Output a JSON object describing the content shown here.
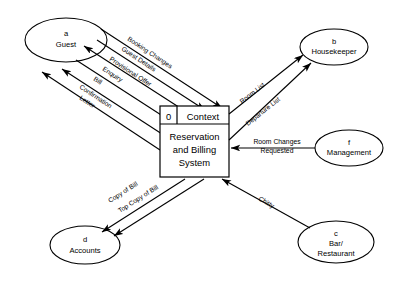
{
  "diagram": {
    "type": "data-flow-diagram",
    "level": "context",
    "colors": {
      "stroke": "#000000",
      "fill": "#ffffff",
      "background": "#ffffff"
    }
  },
  "process": {
    "id": "0",
    "header_label": "Context",
    "name_line1": "Reservation",
    "name_line2": "and Billing",
    "name_line3": "System"
  },
  "entities": [
    {
      "key": "a",
      "id": "a",
      "name": "Guest"
    },
    {
      "key": "b",
      "id": "b",
      "name": "Housekeeper"
    },
    {
      "key": "f",
      "id": "f",
      "name": "Management"
    },
    {
      "key": "c",
      "id": "c",
      "name_line1": "Bar/",
      "name_line2": "Restaurant"
    },
    {
      "key": "d",
      "id": "d",
      "name": "Accounts"
    }
  ],
  "flows": [
    {
      "key": "booking_changes",
      "label": "Booking Changes",
      "from": "a",
      "to": "0"
    },
    {
      "key": "guest_details",
      "label": "Guest Details",
      "from": "a",
      "to": "0"
    },
    {
      "key": "provisional_offer",
      "label": "Provisional Offer",
      "from": "0",
      "to": "a"
    },
    {
      "key": "enquiry",
      "label": "Enquiry",
      "from": "a",
      "to": "0"
    },
    {
      "key": "bill",
      "label": "Bill",
      "from": "0",
      "to": "a"
    },
    {
      "key": "confirmation_letter_1",
      "label": "Confirmation",
      "from": "0",
      "to": "a"
    },
    {
      "key": "confirmation_letter_2",
      "label": "Letter",
      "from": "0",
      "to": "a"
    },
    {
      "key": "room_list",
      "label": "Room List",
      "from": "0",
      "to": "b"
    },
    {
      "key": "departure_list",
      "label": "Departure List",
      "from": "0",
      "to": "b"
    },
    {
      "key": "room_changes_requested_1",
      "label": "Room Changes",
      "from": "f",
      "to": "0"
    },
    {
      "key": "room_changes_requested_2",
      "label": "Requested",
      "from": "f",
      "to": "0"
    },
    {
      "key": "chitty",
      "label": "Chitty",
      "from": "c",
      "to": "0"
    },
    {
      "key": "copy_of_bill",
      "label": "Copy of Bill",
      "from": "0",
      "to": "d"
    },
    {
      "key": "top_copy_of_bill",
      "label": "Top Copy of Bill",
      "from": "0",
      "to": "d"
    }
  ]
}
